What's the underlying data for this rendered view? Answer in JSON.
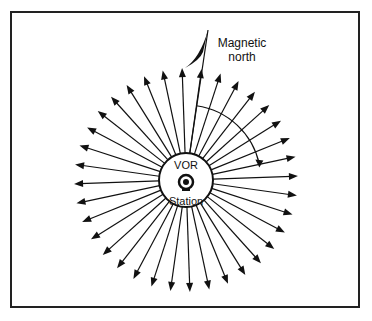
{
  "diagram": {
    "center_label_top": "VOR",
    "center_label_bottom": "Station",
    "north_label_line1": "Magnetic",
    "north_label_line2": "north",
    "radial_count": 36,
    "north_offset_deg": 8,
    "arc_span_deg": 70,
    "colors": {
      "stroke": "#111111",
      "background": "#ffffff"
    }
  }
}
